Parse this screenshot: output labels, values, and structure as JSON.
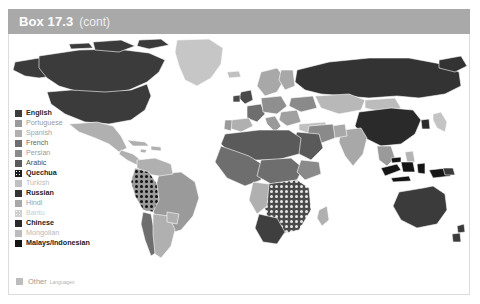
{
  "header": {
    "title": "Box 17.3",
    "continued": "(cont)",
    "bar_color": "#a9a9a9",
    "title_color": "#ffffff"
  },
  "map": {
    "name": "world-language-map",
    "background": "#ffffff",
    "border_color": "#ffffff"
  },
  "legend": {
    "items": [
      {
        "label": "English",
        "color": "#3b3b3b",
        "text_color": "#2b2b2b",
        "bold": true,
        "pattern": "solid"
      },
      {
        "label": "Portuguese",
        "color": "#9a9a9a",
        "text_color": "#9a9a9a",
        "bold": false,
        "pattern": "solid"
      },
      {
        "label": "Spanish",
        "color": "#b0b0b0",
        "text_color": "#a3a3a3",
        "bold": false,
        "pattern": "solid"
      },
      {
        "label": "French",
        "color": "#6e6e6e",
        "text_color": "#666666",
        "bold": false,
        "pattern": "solid"
      },
      {
        "label": "Persian",
        "color": "#8a8a8a",
        "text_color": "#9a9a9a",
        "bold": false,
        "pattern": "solid"
      },
      {
        "label": "Arabic",
        "color": "#5a5a5a",
        "text_color": "#4a4a4a",
        "bold": false,
        "pattern": "solid"
      },
      {
        "label": "Quechua",
        "color": "#1e1e1e",
        "text_color": "#1e1e1e",
        "bold": true,
        "pattern": "dotted"
      },
      {
        "label": "Turkish",
        "color": "#c0c0c0",
        "text_color": "#bdbdbd",
        "bold": false,
        "pattern": "solid"
      },
      {
        "label": "Russian",
        "color": "#333333",
        "text_color": "#272727",
        "bold": true,
        "pattern": "solid"
      },
      {
        "label": "Hindi",
        "color": "#a8a8a8",
        "text_color": "#a0a0a0",
        "bold": false,
        "pattern": "solid"
      },
      {
        "label": "Bantu",
        "color": "#cfcfcf",
        "text_color": "#cbcbcb",
        "bold": false,
        "pattern": "dotted"
      },
      {
        "label": "Chinese",
        "color": "#2a2a2a",
        "text_color": "#222222",
        "bold": true,
        "pattern": "solid"
      },
      {
        "label": "Mongolian",
        "color": "#bcbcbc",
        "text_color": "#b8b8b8",
        "bold": false,
        "pattern": "solid"
      },
      {
        "label": "Malays/Indonesian",
        "color": "#151515",
        "text_color": "#1a1a1a",
        "bold": true,
        "pattern": "solid"
      }
    ],
    "other": {
      "label": "Other",
      "sublabel": "Languages",
      "color": "#bdbdbd"
    }
  }
}
